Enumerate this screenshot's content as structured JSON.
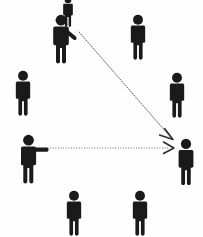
{
  "diagram": {
    "title": "Crowd of pedestrian figures with two pointing indicators",
    "type": "pictogram-scene",
    "background_color": "#fefefe",
    "figure_color": "#1a1a1a",
    "line_color": "#4a4a4a",
    "canvas": {
      "width": 203,
      "height": 237
    },
    "figures": [
      {
        "id": "figure-top-partial",
        "label": "partial figure top edge",
        "pose": "standing",
        "x": 68,
        "y": 2,
        "scale": 0.62,
        "clipped": true,
        "arm": "none"
      },
      {
        "id": "figure-pointer-top",
        "label": "pointing figure upper left",
        "pose": "pointing-diagonal",
        "x": 66,
        "y": 14,
        "scale": 1.0,
        "clipped": false,
        "arm": "diagonal-down-right"
      },
      {
        "id": "figure-top-right",
        "label": "standing figure upper right",
        "pose": "standing",
        "x": 138,
        "y": 14,
        "scale": 0.92,
        "clipped": false,
        "arm": "none"
      },
      {
        "id": "figure-mid-left",
        "label": "standing figure middle left",
        "pose": "standing",
        "x": 23,
        "y": 70,
        "scale": 0.92,
        "clipped": false,
        "arm": "none"
      },
      {
        "id": "figure-mid-right",
        "label": "standing figure middle right",
        "pose": "standing",
        "x": 177,
        "y": 72,
        "scale": 0.92,
        "clipped": false,
        "arm": "none"
      },
      {
        "id": "figure-pointer-left",
        "label": "pointing figure center left",
        "pose": "pointing-horizontal",
        "x": 30,
        "y": 134,
        "scale": 1.0,
        "clipped": false,
        "arm": "horizontal-right"
      },
      {
        "id": "figure-target",
        "label": "target figure center right",
        "pose": "standing",
        "x": 186,
        "y": 138,
        "scale": 0.95,
        "clipped": false,
        "arm": "none"
      },
      {
        "id": "figure-bottom-left",
        "label": "standing figure bottom left",
        "pose": "standing",
        "x": 74,
        "y": 190,
        "scale": 0.92,
        "clipped": false,
        "arm": "none"
      },
      {
        "id": "figure-bottom-right",
        "label": "standing figure bottom right",
        "pose": "standing",
        "x": 140,
        "y": 190,
        "scale": 0.92,
        "clipped": false,
        "arm": "none"
      }
    ],
    "pointing_lines": [
      {
        "id": "line-diagonal",
        "label": "diagonal dotted pointing line",
        "from_figure": "figure-pointer-top",
        "to_figure": "figure-target",
        "start": {
          "x": 79,
          "y": 32
        },
        "end": {
          "x": 173,
          "y": 140
        },
        "style": "dotted",
        "arrowhead": true
      },
      {
        "id": "line-horizontal",
        "label": "horizontal dotted pointing line",
        "from_figure": "figure-pointer-left",
        "to_figure": "figure-target",
        "start": {
          "x": 45,
          "y": 148
        },
        "end": {
          "x": 174,
          "y": 148
        },
        "style": "dotted",
        "arrowhead": true
      }
    ]
  }
}
